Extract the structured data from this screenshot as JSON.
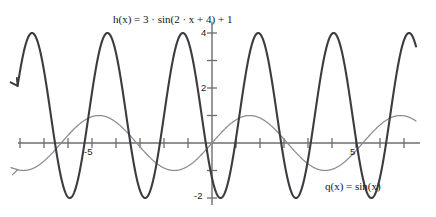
{
  "figure": {
    "kind": "math-function-plot",
    "background_color": "#ffffff"
  },
  "labels": {
    "h_equation": "h(x) = 3 · sin(2 · x + 4) + 1",
    "q_equation": "q(x) = sin(x)"
  },
  "axes": {
    "x_tick_labels": [
      "-5",
      "5"
    ],
    "y_tick_labels": [
      "4",
      "2",
      "-2"
    ],
    "x_axis_color": "#6e6e6e",
    "y_axis_color": "#6e6e6e"
  },
  "chart_data": {
    "type": "line",
    "title": "",
    "xlabel": "x",
    "ylabel": "y",
    "xlim": [
      -8.1,
      8.7
    ],
    "ylim": [
      -2.4,
      4.4
    ],
    "grid": false,
    "legend": "inline-annotations",
    "x_ticks": [
      -8,
      -7,
      -6,
      -5,
      -4,
      -3,
      -2,
      -1,
      1,
      2,
      3,
      4,
      5,
      6,
      7,
      8
    ],
    "x_tick_labels_shown": {
      "-5": "-5",
      "5": "5"
    },
    "y_ticks": [
      -2,
      -1,
      1,
      2,
      3,
      4
    ],
    "y_tick_labels_shown": {
      "4": "4",
      "2": "2",
      "-2": "-2"
    },
    "series": [
      {
        "name": "h(x) = 3 · sin(2 · x + 4) + 1",
        "expression": "3*sin(2*x+4)+1",
        "amplitude": 3,
        "frequency": 2,
        "phase": 4,
        "offset": 1,
        "ymin": -2,
        "ymax": 4,
        "period": 3.1416,
        "color": "#3b3b42",
        "stroke_width": 2.1,
        "arrow_at": "left-end-up",
        "x_range": [
          -8.1,
          8.5
        ]
      },
      {
        "name": "q(x) = sin(x)",
        "expression": "sin(x)",
        "amplitude": 1,
        "frequency": 1,
        "phase": 0,
        "offset": 0,
        "ymin": -1,
        "ymax": 1,
        "period": 6.2832,
        "color": "#8b8b92",
        "stroke_width": 1.25,
        "arrow_at": "left-end-flat",
        "x_range": [
          -8.1,
          8.5
        ]
      }
    ]
  }
}
